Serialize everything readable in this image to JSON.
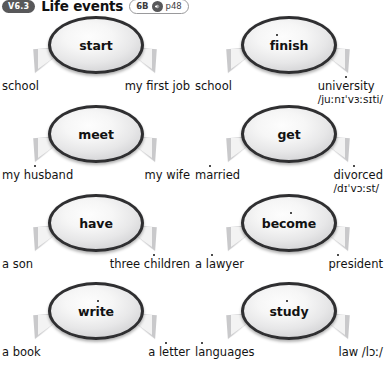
{
  "header": {
    "unit_badge": "V6.3",
    "title": "Life events",
    "ref_level": "6B",
    "audio_icon": "speaker-icon",
    "ref_page": "p48"
  },
  "groups": [
    {
      "verb": "start",
      "verb_stress_index": null,
      "left_label": "school",
      "right_label": "my first job",
      "right_ipa": "",
      "left_stress_index": null,
      "right_stress_index": null
    },
    {
      "verb": "finish",
      "verb_stress_index": 1,
      "left_label": "school",
      "right_label": "university",
      "right_ipa": "/juːnɪˈvɜːsɪti/",
      "left_stress_index": null,
      "right_stress_index": 4
    },
    {
      "verb": "meet",
      "verb_stress_index": null,
      "left_label": "my husband",
      "right_label": "my wife",
      "right_ipa": "",
      "left_stress_index": 4,
      "right_stress_index": null
    },
    {
      "verb": "get",
      "verb_stress_index": null,
      "left_label": "married",
      "right_label": "divorced",
      "right_ipa": "/dɪˈvɔːst/",
      "left_stress_index": 1,
      "right_stress_index": 3
    },
    {
      "verb": "have",
      "verb_stress_index": null,
      "left_label": "a son",
      "right_label": "three children",
      "right_ipa": "",
      "left_stress_index": null,
      "right_stress_index": 7
    },
    {
      "verb": "become",
      "verb_stress_index": 3,
      "left_label": "a lawyer",
      "right_label": "president",
      "right_ipa": "",
      "left_stress_index": 3,
      "right_stress_index": 1
    },
    {
      "verb": "write",
      "verb_stress_index": 2,
      "left_label": "a book",
      "right_label": "a letter",
      "right_ipa": "",
      "left_stress_index": null,
      "right_stress_index": 3
    },
    {
      "verb": "study",
      "verb_stress_index": 2,
      "left_label": "languages",
      "right_label": "law /lɔː/",
      "right_ipa": "",
      "left_stress_index": 1,
      "right_stress_index": null
    }
  ],
  "colors": {
    "badge_bg": "#58585a",
    "bubble_border": "#2f2f31",
    "text": "#131313",
    "page_bg": "#ffffff"
  }
}
